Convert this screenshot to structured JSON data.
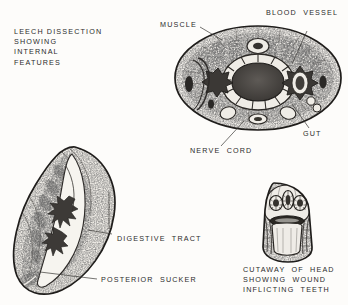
{
  "plate": {
    "background_color": "#fdfcfa",
    "ink_color": "#2b2b2b",
    "title_block": "LEECH DISSECTION\nSHOWING\nINTERNAL\nFEATURES",
    "title_lines": [
      "LEECH  DISSECTION",
      "SHOWING",
      "INTERNAL",
      "FEATURES"
    ],
    "cropped_top_text": "",
    "labels": {
      "muscle": "MUSCLE",
      "blood_vessel": "BLOOD  VESSEL",
      "gut": "GUT",
      "nerve_cord": "NERVE  CORD",
      "digestive_tract": "DIGESTIVE  TRACT",
      "posterior_sucker": "POSTERIOR  SUCKER"
    },
    "head_caption_lines": [
      "CUTAWAY  OF  HEAD",
      "SHOWING  WOUND",
      "INFLICTING  TEETH"
    ],
    "figures": {
      "longitudinal": "longitudinal-leech-dissection",
      "transverse": "transverse-section",
      "head": "head-cutaway"
    }
  }
}
